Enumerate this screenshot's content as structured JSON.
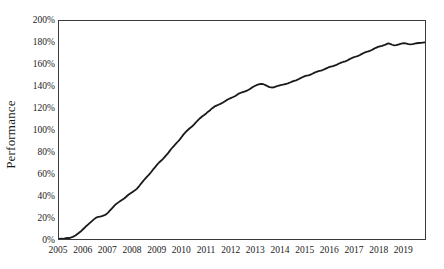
{
  "chart_data": {
    "type": "line",
    "title": "",
    "xlabel": "",
    "ylabel": "Performance",
    "grid": false,
    "legend": false,
    "legend_position": "none",
    "line_color": "#1a1a1a",
    "axis_color": "#3a3a3a",
    "background_color": "#ffffff",
    "xlim": [
      2005,
      2019.92
    ],
    "ylim": [
      0,
      200
    ],
    "ytick_labels": [
      "200%",
      "180%",
      "160%",
      "140%",
      "120%",
      "100%",
      "80%",
      "60%",
      "40%",
      "20%",
      "0%"
    ],
    "ytick_values": [
      200,
      180,
      160,
      140,
      120,
      100,
      80,
      60,
      40,
      20,
      0
    ],
    "xtick_labels": [
      "2005",
      "2006",
      "2007",
      "2008",
      "2009",
      "2010",
      "2011",
      "2012",
      "2013",
      "2014",
      "2015",
      "2016",
      "2017",
      "2018",
      "2019"
    ],
    "xtick_values": [
      2005,
      2006,
      2007,
      2008,
      2009,
      2010,
      2011,
      2012,
      2013,
      2014,
      2015,
      2016,
      2017,
      2018,
      2019
    ],
    "series": [
      {
        "name": "Performance",
        "x": [
          2005.0,
          2005.08,
          2005.17,
          2005.25,
          2005.33,
          2005.42,
          2005.5,
          2005.58,
          2005.67,
          2005.75,
          2005.83,
          2005.92,
          2006.0,
          2006.08,
          2006.17,
          2006.25,
          2006.33,
          2006.42,
          2006.5,
          2006.58,
          2006.67,
          2006.75,
          2006.83,
          2006.92,
          2007.0,
          2007.08,
          2007.17,
          2007.25,
          2007.33,
          2007.42,
          2007.5,
          2007.58,
          2007.67,
          2007.75,
          2007.83,
          2007.92,
          2008.0,
          2008.08,
          2008.17,
          2008.25,
          2008.33,
          2008.42,
          2008.5,
          2008.58,
          2008.67,
          2008.75,
          2008.83,
          2008.92,
          2009.0,
          2009.08,
          2009.17,
          2009.25,
          2009.33,
          2009.42,
          2009.5,
          2009.58,
          2009.67,
          2009.75,
          2009.83,
          2009.92,
          2010.0,
          2010.08,
          2010.17,
          2010.25,
          2010.33,
          2010.42,
          2010.5,
          2010.58,
          2010.67,
          2010.75,
          2010.83,
          2010.92,
          2011.0,
          2011.08,
          2011.17,
          2011.25,
          2011.33,
          2011.42,
          2011.5,
          2011.58,
          2011.67,
          2011.75,
          2011.83,
          2011.92,
          2012.0,
          2012.08,
          2012.17,
          2012.25,
          2012.33,
          2012.42,
          2012.5,
          2012.58,
          2012.67,
          2012.75,
          2012.83,
          2012.92,
          2013.0,
          2013.08,
          2013.17,
          2013.25,
          2013.33,
          2013.42,
          2013.5,
          2013.58,
          2013.67,
          2013.75,
          2013.83,
          2013.92,
          2014.0,
          2014.08,
          2014.17,
          2014.25,
          2014.33,
          2014.42,
          2014.5,
          2014.58,
          2014.67,
          2014.75,
          2014.83,
          2014.92,
          2015.0,
          2015.08,
          2015.17,
          2015.25,
          2015.33,
          2015.42,
          2015.5,
          2015.58,
          2015.67,
          2015.75,
          2015.83,
          2015.92,
          2016.0,
          2016.08,
          2016.17,
          2016.25,
          2016.33,
          2016.42,
          2016.5,
          2016.58,
          2016.67,
          2016.75,
          2016.83,
          2016.92,
          2017.0,
          2017.08,
          2017.17,
          2017.25,
          2017.33,
          2017.42,
          2017.5,
          2017.58,
          2017.67,
          2017.75,
          2017.83,
          2017.92,
          2018.0,
          2018.08,
          2018.17,
          2018.25,
          2018.33,
          2018.42,
          2018.5,
          2018.58,
          2018.67,
          2018.75,
          2018.83,
          2018.92,
          2019.0,
          2019.08,
          2019.17,
          2019.25,
          2019.33,
          2019.42,
          2019.5,
          2019.58,
          2019.67,
          2019.75,
          2019.83,
          2019.92
        ],
        "values": [
          0.0,
          0.3,
          0.2,
          0.6,
          1.0,
          0.8,
          1.4,
          2.2,
          3.2,
          4.6,
          6.0,
          7.6,
          9.4,
          11.2,
          13.0,
          14.6,
          16.2,
          18.0,
          19.4,
          20.2,
          20.6,
          21.0,
          21.6,
          22.6,
          24.2,
          26.2,
          28.4,
          30.4,
          32.2,
          33.6,
          34.8,
          36.0,
          37.4,
          39.0,
          40.6,
          42.0,
          43.2,
          44.4,
          46.0,
          48.0,
          50.4,
          52.8,
          55.0,
          57.0,
          59.0,
          61.2,
          63.6,
          66.0,
          68.2,
          70.2,
          72.0,
          73.8,
          75.8,
          78.0,
          80.4,
          82.8,
          85.0,
          87.0,
          89.0,
          91.2,
          93.6,
          96.0,
          98.2,
          100.0,
          101.6,
          103.2,
          105.0,
          107.0,
          109.0,
          110.8,
          112.4,
          113.8,
          115.2,
          116.8,
          118.4,
          120.0,
          121.4,
          122.4,
          123.2,
          124.0,
          125.0,
          126.2,
          127.4,
          128.4,
          129.2,
          130.0,
          131.0,
          132.2,
          133.4,
          134.2,
          134.8,
          135.4,
          136.2,
          137.2,
          138.4,
          139.6,
          140.6,
          141.4,
          142.0,
          142.4,
          142.0,
          141.2,
          140.2,
          139.4,
          139.0,
          139.2,
          139.8,
          140.4,
          141.0,
          141.4,
          141.8,
          142.2,
          142.8,
          143.6,
          144.4,
          145.0,
          145.6,
          146.4,
          147.4,
          148.4,
          149.2,
          149.8,
          150.2,
          150.8,
          151.6,
          152.6,
          153.4,
          154.0,
          154.4,
          155.0,
          155.8,
          156.8,
          157.6,
          158.2,
          158.6,
          159.2,
          160.0,
          161.0,
          161.8,
          162.4,
          163.0,
          163.8,
          164.8,
          165.8,
          166.6,
          167.2,
          167.8,
          168.6,
          169.6,
          170.6,
          171.4,
          172.0,
          172.6,
          173.4,
          174.4,
          175.4,
          176.2,
          176.8,
          177.2,
          177.8,
          178.6,
          179.4,
          179.0,
          178.2,
          177.6,
          177.8,
          178.4,
          179.0,
          179.4,
          179.6,
          179.2,
          178.8,
          178.6,
          178.8,
          179.2,
          179.6,
          179.8,
          180.0,
          180.2,
          180.4
        ]
      }
    ]
  }
}
